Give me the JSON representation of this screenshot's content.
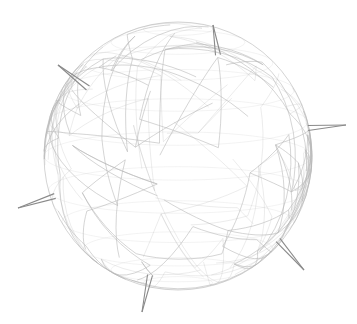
{
  "scene": {
    "subject": "wireframe sphere lamp with spikes",
    "background": "#ffffff",
    "wire_color": "#b8b8b8",
    "spike_color": "#8a8a8a",
    "sphere": {
      "cx": 178,
      "cy": 156,
      "r": 134
    },
    "spikes": [
      {
        "name": "top",
        "x1": 218,
        "y1": 55,
        "x2": 213,
        "y2": 25
      },
      {
        "name": "upper-left",
        "x1": 88,
        "y1": 88,
        "x2": 58,
        "y2": 65
      },
      {
        "name": "right",
        "x1": 308,
        "y1": 128,
        "x2": 346,
        "y2": 125
      },
      {
        "name": "left",
        "x1": 55,
        "y1": 196,
        "x2": 18,
        "y2": 208
      },
      {
        "name": "bottom",
        "x1": 150,
        "y1": 275,
        "x2": 142,
        "y2": 312
      },
      {
        "name": "bottom-right",
        "x1": 278,
        "y1": 240,
        "x2": 304,
        "y2": 270
      }
    ]
  }
}
